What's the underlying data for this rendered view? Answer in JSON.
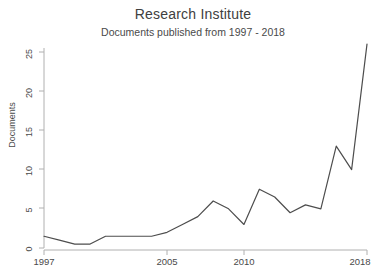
{
  "chart_data": {
    "type": "line",
    "title": "Research Institute",
    "subtitle": "Documents published from 1997 - 2018",
    "xlabel": "",
    "ylabel": "Documents",
    "x": [
      1997,
      1998,
      1999,
      2000,
      2001,
      2002,
      2003,
      2004,
      2005,
      2006,
      2007,
      2008,
      2009,
      2010,
      2011,
      2012,
      2013,
      2014,
      2015,
      2016,
      2017,
      2018
    ],
    "values": [
      1.5,
      1,
      0.5,
      0.5,
      1.5,
      1.5,
      1.5,
      1.5,
      2,
      3,
      4,
      6,
      5,
      3,
      7.5,
      6.5,
      4.5,
      5.5,
      5,
      13,
      10,
      26
    ],
    "series": [
      {
        "name": "Documents",
        "values": [
          1.5,
          1,
          0.5,
          0.5,
          1.5,
          1.5,
          1.5,
          1.5,
          2,
          3,
          4,
          6,
          5,
          3,
          7.5,
          6.5,
          4.5,
          5.5,
          5,
          13,
          10,
          26
        ]
      }
    ],
    "xlim": [
      1997,
      2018
    ],
    "ylim": [
      0,
      27
    ],
    "xticks": [
      1997,
      2005,
      2010,
      2018
    ],
    "xtick_labels": [
      "1997",
      "2005",
      "2010",
      "2018"
    ],
    "yticks": [
      0,
      5,
      10,
      15,
      20,
      25
    ],
    "ytick_labels": [
      "0",
      "5",
      "10",
      "15",
      "20",
      "25"
    ],
    "grid": false,
    "legend": false,
    "line_color": "#4d4d4d",
    "axis_color": "#b0b0b0",
    "background": "#ffffff"
  },
  "ytick_labels": {
    "t0": "0",
    "t1": "5",
    "t2": "10",
    "t3": "15",
    "t4": "20",
    "t5": "25"
  },
  "xtick_labels": {
    "t0": "1997",
    "t1": "2005",
    "t2": "2010",
    "t3": "2018"
  }
}
